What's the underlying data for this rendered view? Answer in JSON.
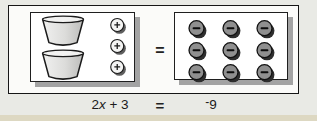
{
  "model": {
    "left_panel": {
      "cup_count": 2,
      "plus_counter_count": 3
    },
    "right_panel": {
      "minus_counter_count": 9
    },
    "equals_sign": "="
  },
  "equation": {
    "lhs_coefficient": "2",
    "lhs_variable": "x",
    "lhs_plus_term": " + 3",
    "equals_sign": "=",
    "rhs_sign": "-",
    "rhs_value": "9"
  },
  "icons": {
    "cup": "cup-icon",
    "positive_counter": "plus-counter-icon",
    "negative_counter": "minus-counter-icon"
  },
  "colors": {
    "background": "#e9eae5",
    "page_edge": "#ddd8c2",
    "box_fill": "#fbfbf9",
    "panel_fill": "#ffffff",
    "panel_shadow": "#a3a3a3",
    "positive_counter_fill": "#f4f4f3",
    "negative_counter_fill": "#8f8f8f",
    "outline": "#1b1b1b"
  }
}
